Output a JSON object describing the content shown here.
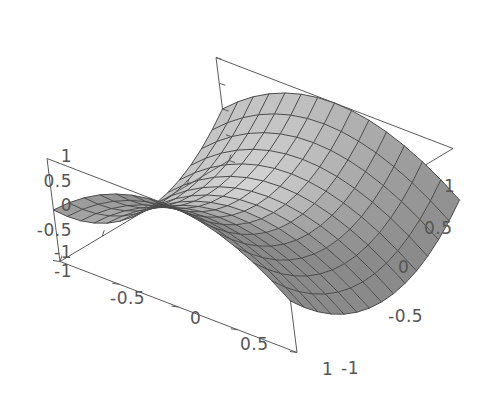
{
  "figure": {
    "kind": "3d-surface-plot",
    "title": "",
    "background_color": "#ffffff",
    "axis_color": "#5a5a5a",
    "mesh_color": "#4a4a4a",
    "label_color": "#555555"
  },
  "chart_data": {
    "type": "surface3d",
    "title": "",
    "xlabel": "",
    "ylabel": "",
    "zlabel": "",
    "function": "z = x^2 - y^2",
    "xlim": [
      -1,
      1
    ],
    "ylim": [
      -1,
      1
    ],
    "zlim": [
      -1,
      1
    ],
    "grid": false,
    "legend": "none",
    "mesh_divisions": 14,
    "x_ticks": [
      "-1",
      "-0.5",
      "0",
      "0.5",
      "1"
    ],
    "x_tick_values": [
      -1,
      -0.5,
      0,
      0.5,
      1
    ],
    "y_ticks": [
      "-1",
      "-0.5",
      "0",
      "0.5",
      "1"
    ],
    "y_tick_values": [
      -1,
      -0.5,
      0,
      0.5,
      1
    ],
    "z_ticks": [
      "-1",
      "-0.5",
      "0",
      "0.5",
      "1"
    ],
    "z_tick_values": [
      -1,
      -0.5,
      0,
      0.5,
      1
    ],
    "surface_shading": "gray",
    "surface_fill_light": "#d2d2d2",
    "surface_fill_dark": "#8a8a8a",
    "corner_values": {
      "x_-1_y_-1": 0,
      "x_-1_y_1": 0,
      "x_1_y_-1": 0,
      "x_1_y_1": 0,
      "x_0_y_0": 0
    }
  },
  "axes": {
    "z_axis": {
      "name": "z-axis",
      "position": "left",
      "ticks": [
        {
          "label": "1",
          "value": 1
        },
        {
          "label": "0.5",
          "value": 0.5
        },
        {
          "label": "0",
          "value": 0
        },
        {
          "label": "-0.5",
          "value": -0.5
        },
        {
          "label": "-1",
          "value": -1
        }
      ]
    },
    "x_axis": {
      "name": "x-axis",
      "position": "bottom-left",
      "ticks": [
        {
          "label": "-1",
          "value": -1
        },
        {
          "label": "-0.5",
          "value": -0.5
        },
        {
          "label": "0",
          "value": 0
        },
        {
          "label": "0.5",
          "value": 0.5
        },
        {
          "label": "1",
          "value": 1
        }
      ]
    },
    "y_axis": {
      "name": "y-axis",
      "position": "bottom-right",
      "ticks": [
        {
          "label": "-1",
          "value": -1
        },
        {
          "label": "-0.5",
          "value": -0.5
        },
        {
          "label": "0",
          "value": 0
        },
        {
          "label": "0.5",
          "value": 0.5
        },
        {
          "label": "1",
          "value": 1
        }
      ]
    }
  },
  "labels": {
    "z1": "1",
    "z05": "0.5",
    "z0": "0",
    "zm05": "-0.5",
    "zm1": "-1",
    "xm1": "-1",
    "xm05": "-0.5",
    "x0": "0",
    "x05": "0.5",
    "x1": "1",
    "ym1": "-1",
    "ym05": "-0.5",
    "y0": "0",
    "y05": "0.5",
    "y1": "1"
  }
}
